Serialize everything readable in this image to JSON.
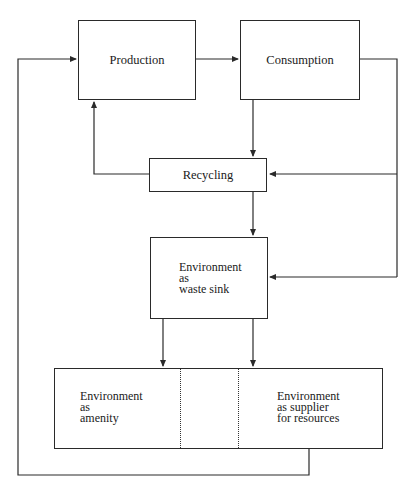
{
  "diagram": {
    "type": "flow",
    "nodes": {
      "production": {
        "label": "Production"
      },
      "consumption": {
        "label": "Consumption"
      },
      "recycling": {
        "label": "Recycling"
      },
      "waste_sink": {
        "lines": [
          "Environment",
          "as",
          "waste sink"
        ]
      },
      "amenity": {
        "lines": [
          "Environment",
          "as",
          "amenity"
        ]
      },
      "supplier": {
        "lines": [
          "Environment",
          "as supplier",
          "for resources"
        ]
      }
    },
    "edges": [
      {
        "from": "production",
        "to": "consumption"
      },
      {
        "from": "consumption",
        "to": "recycling"
      },
      {
        "from": "consumption",
        "to": "recycling",
        "via": "right-loop"
      },
      {
        "from": "consumption",
        "to": "waste_sink",
        "via": "right-loop"
      },
      {
        "from": "recycling",
        "to": "production"
      },
      {
        "from": "recycling",
        "to": "waste_sink"
      },
      {
        "from": "waste_sink",
        "to": "amenity"
      },
      {
        "from": "waste_sink",
        "to": "supplier"
      },
      {
        "from": "supplier",
        "to": "production",
        "via": "outer-loop"
      }
    ],
    "colors": {
      "line": "#2a2a2a",
      "background": "#ffffff"
    }
  }
}
